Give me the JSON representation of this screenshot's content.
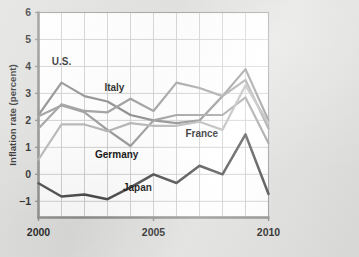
{
  "figure": {
    "background_color": "#dededc",
    "plot_background_color": "#ffffff",
    "grid_color": "#c9c9c9",
    "frame_color": "#9a9a9a",
    "axis_color": "#8d8d8d"
  },
  "axes": {
    "y_axis_label": "Inflation rate (percent)",
    "y_tick_labels": [
      "6",
      "5",
      "4",
      "3",
      "2",
      "1",
      "0",
      "−1"
    ],
    "y_tick_values": [
      6,
      5,
      4,
      3,
      2,
      1,
      0,
      -1
    ],
    "y_limits": [
      -1.6,
      6.0
    ],
    "x_tick_labels": [
      "2000",
      "2005",
      "2010"
    ],
    "x_tick_values": [
      2000,
      2005,
      2010
    ],
    "x_limits": [
      2000,
      2010
    ],
    "x_gridline_years": [
      2000,
      2001,
      2002,
      2003,
      2004,
      2005,
      2006,
      2007,
      2008,
      2009,
      2010
    ],
    "grid": "on",
    "legend_position": "inline-annotations"
  },
  "chart_data": {
    "type": "line",
    "title": "",
    "subtitle": "",
    "xlabel": "",
    "ylabel": "Inflation rate (percent)",
    "xlim": [
      2000,
      2010
    ],
    "ylim": [
      -1.6,
      6.0
    ],
    "grid": true,
    "legend_position": "inline-annotations",
    "x": [
      2000,
      2001,
      2002,
      2003,
      2004,
      2005,
      2006,
      2007,
      2008,
      2009,
      2010
    ],
    "series": [
      {
        "name": "U.S.",
        "color": "#8b8b8b",
        "label": "U.S.",
        "label_x": 2001.0,
        "label_y": 4.05,
        "values": [
          2.2,
          3.4,
          2.9,
          2.7,
          2.2,
          2.0,
          1.9,
          2.0,
          2.9,
          3.9,
          2.0
        ]
      },
      {
        "name": "Italy",
        "color": "#9d9d9d",
        "label": "Italy",
        "label_x": 2003.3,
        "label_y": 3.1,
        "values": [
          1.7,
          2.6,
          2.35,
          2.3,
          2.8,
          2.35,
          3.4,
          3.2,
          2.9,
          3.5,
          1.7
        ]
      },
      {
        "name": "Germany",
        "color": "#9a9a9a",
        "label": "Germany",
        "label_x": 2003.4,
        "label_y": 0.62,
        "values": [
          2.15,
          2.55,
          2.3,
          1.65,
          1.05,
          2.0,
          2.2,
          2.2,
          2.2,
          2.85,
          1.15
        ]
      },
      {
        "name": "France",
        "color": "#b5b5b5",
        "label": "France",
        "label_x": 2007.1,
        "label_y": 1.38,
        "values": [
          0.55,
          1.85,
          1.85,
          1.6,
          1.9,
          1.8,
          1.8,
          1.95,
          1.65,
          3.3,
          1.9
        ]
      },
      {
        "name": "Japan",
        "color": "#4a4a4a",
        "label": "Japan",
        "label_x": 2004.3,
        "label_y": -0.62,
        "values": [
          -0.33,
          -0.82,
          -0.75,
          -0.92,
          -0.48,
          0.0,
          -0.32,
          0.32,
          0.0,
          1.48,
          -0.73
        ]
      }
    ]
  }
}
